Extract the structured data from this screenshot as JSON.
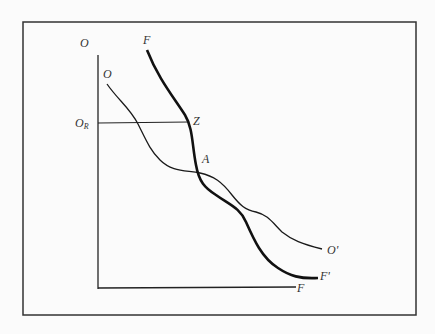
{
  "diagram": {
    "type": "curve-diagram",
    "labels": {
      "y_axis_top": "O",
      "curve_o_start": "O",
      "curve_o_end": "O'",
      "curve_f_start": "F",
      "curve_f_end": "F'",
      "x_axis_end": "F",
      "level_main": "O",
      "level_sub": "R",
      "point_z": "Z",
      "point_a": "A"
    },
    "curves": [
      {
        "name": "O-O'",
        "style": "thin"
      },
      {
        "name": "F-F'",
        "style": "thick"
      }
    ],
    "colors": {
      "line": "#1a1a1a",
      "background": "#fbfbfb"
    }
  }
}
